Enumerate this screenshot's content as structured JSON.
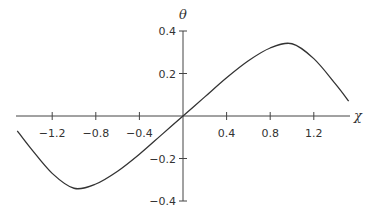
{
  "chart_data": {
    "type": "line",
    "title": "",
    "xlabel": "χ",
    "ylabel": "θ",
    "xlim": [
      -1.53,
      1.53
    ],
    "ylim": [
      -0.4,
      0.4
    ],
    "grid": false,
    "x_ticks": [
      -1.2,
      -0.8,
      -0.4,
      0.4,
      0.8,
      1.2
    ],
    "x_tick_labels": [
      "−1.2",
      "−0.8",
      "−0.4",
      "0.4",
      "0.8",
      "1.2"
    ],
    "y_ticks": [
      0.4,
      0.2,
      -0.2,
      -0.4
    ],
    "y_tick_labels": [
      "0.4",
      "0.2",
      "−0.2",
      "−0.4"
    ],
    "series": [
      {
        "name": "θ(χ)",
        "color": "#333333",
        "x": [
          -1.52,
          -1.4,
          -1.2,
          -1.0,
          -0.8,
          -0.6,
          -0.4,
          -0.2,
          0.0,
          0.2,
          0.4,
          0.6,
          0.8,
          1.0,
          1.2,
          1.4,
          1.52
        ],
        "y": [
          -0.07,
          -0.15,
          -0.27,
          -0.34,
          -0.32,
          -0.26,
          -0.18,
          -0.09,
          0.0,
          0.09,
          0.18,
          0.26,
          0.32,
          0.34,
          0.27,
          0.15,
          0.07
        ]
      }
    ]
  }
}
